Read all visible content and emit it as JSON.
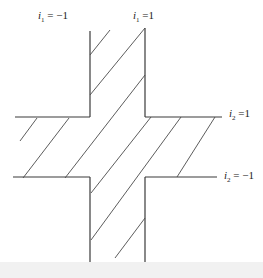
{
  "diagram": {
    "type": "shaded cross-shaped region",
    "labels": {
      "i1_neg": {
        "var": "i",
        "sub": "1",
        "rel": " = ",
        "value": "−1"
      },
      "i1_pos": {
        "var": "i",
        "sub": "1",
        "rel": " =",
        "value": "1"
      },
      "i2_pos": {
        "var": "i",
        "sub": "2",
        "rel": " =",
        "value": "1"
      },
      "i2_neg": {
        "var": "i",
        "sub": "2",
        "rel": " = ",
        "value": "−1"
      }
    },
    "colors": {
      "line": "#3a3a3a",
      "background": "#ffffff"
    }
  }
}
